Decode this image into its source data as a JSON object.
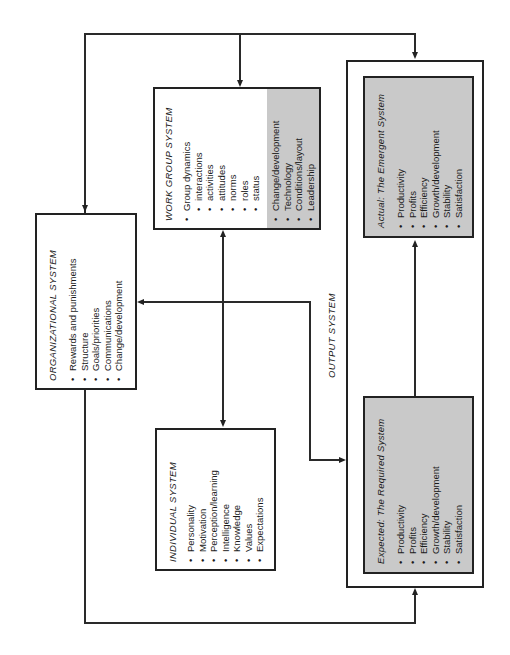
{
  "organizational_system": {
    "title": "ORGANIZATIONAL SYSTEM",
    "items": [
      "Rewards and punishments",
      "Structure",
      "Goals/priorities",
      "Communications",
      "Change/development"
    ]
  },
  "work_group_system": {
    "title": "WORK GROUP SYSTEM",
    "group_dynamics": {
      "label": "Group dynamics",
      "subitems": [
        "interactions",
        "activities",
        "attitudes",
        "norms",
        "roles",
        "status"
      ]
    },
    "shaded_items": [
      "Change/development",
      "Technology",
      "Conditions/layout",
      "Leadership"
    ]
  },
  "individual_system": {
    "title": "INDIVIDUAL SYSTEM",
    "items": [
      "Personality",
      "Motivation",
      "Perception/learning",
      "Intelligence",
      "Knowledge",
      "Values",
      "Expectations"
    ]
  },
  "output_system": {
    "title": "OUTPUT SYSTEM",
    "actual": {
      "title_prefix": "Actual:",
      "title": "The Emergent System",
      "items": [
        "Productivity",
        "Profits",
        "Efficiency",
        "Growth/development",
        "Stability",
        "Satisfaction"
      ]
    },
    "expected": {
      "title_prefix": "Expected:",
      "title": "The Required System",
      "items": [
        "Productivity",
        "Profits",
        "Efficiency",
        "Growth/development",
        "Stability",
        "Satisfaction"
      ]
    }
  },
  "colors": {
    "line": "#222222",
    "shaded": "#c9c9c9",
    "background": "#ffffff"
  }
}
